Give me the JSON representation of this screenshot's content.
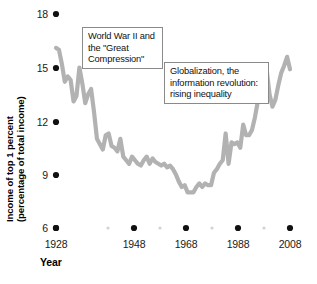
{
  "chart_data": {
    "type": "line",
    "title": "",
    "xlabel": "Year",
    "ylabel": "Income of top 1 percent (percentage of total income)",
    "xlim": [
      1928,
      2008
    ],
    "ylim": [
      6,
      18
    ],
    "grid": false,
    "legend": "none",
    "line_color": "#b2b2b2",
    "x_ticks": [
      "1928",
      "1948",
      "1968",
      "1988",
      "2008"
    ],
    "x_minor_ticks": [
      "1938",
      "1958",
      "1978",
      "1998"
    ],
    "y_ticks": [
      "18",
      "15",
      "12",
      "9",
      "6"
    ],
    "series": [
      {
        "name": "Income share of top 1 percent",
        "x": [
          1928,
          1929,
          1930,
          1931,
          1932,
          1933,
          1934,
          1935,
          1936,
          1937,
          1938,
          1939,
          1940,
          1941,
          1942,
          1943,
          1944,
          1945,
          1946,
          1947,
          1948,
          1949,
          1950,
          1951,
          1952,
          1953,
          1954,
          1955,
          1956,
          1957,
          1958,
          1959,
          1960,
          1961,
          1962,
          1963,
          1964,
          1965,
          1966,
          1967,
          1968,
          1969,
          1970,
          1971,
          1972,
          1973,
          1974,
          1975,
          1976,
          1977,
          1978,
          1979,
          1980,
          1981,
          1982,
          1983,
          1984,
          1985,
          1986,
          1987,
          1988,
          1989,
          1990,
          1991,
          1992,
          1993,
          1994,
          1995,
          1996,
          1997,
          1998,
          1999,
          2000,
          2001,
          2002,
          2003,
          2004,
          2005,
          2006,
          2007,
          2008
        ],
        "values": [
          16.1,
          16.0,
          15.2,
          14.2,
          14.5,
          14.3,
          13.1,
          13.4,
          15.0,
          14.1,
          13.0,
          13.5,
          13.8,
          12.5,
          11.0,
          10.7,
          10.4,
          11.2,
          11.3,
          10.6,
          10.5,
          10.3,
          11.0,
          10.0,
          9.8,
          9.6,
          10.0,
          9.8,
          9.6,
          9.5,
          9.8,
          10.0,
          9.6,
          9.9,
          9.7,
          9.6,
          9.5,
          9.6,
          9.4,
          9.5,
          9.3,
          9.0,
          8.6,
          8.3,
          8.4,
          8.0,
          8.0,
          8.0,
          8.3,
          8.5,
          8.3,
          8.5,
          8.4,
          8.4,
          9.1,
          9.3,
          9.6,
          9.8,
          11.3,
          9.6,
          10.8,
          10.7,
          10.8,
          10.5,
          11.8,
          11.2,
          11.2,
          11.5,
          12.2,
          13.1,
          13.6,
          14.2,
          14.9,
          13.5,
          12.8,
          13.2,
          14.0,
          14.7,
          15.1,
          15.6,
          14.9
        ]
      }
    ]
  },
  "annotations": [
    {
      "id": "ww2",
      "name": "annotation-world-war-2",
      "text": "World War II and the \"Great Compression\""
    },
    {
      "id": "globalization",
      "name": "annotation-globalization",
      "text": "Globalization, the information revolution: rising inequality"
    }
  ],
  "axes": {
    "y_label_line1": "Income of top 1 percent",
    "y_label_line2": "(percentage of total income)",
    "x_label": "Year"
  }
}
